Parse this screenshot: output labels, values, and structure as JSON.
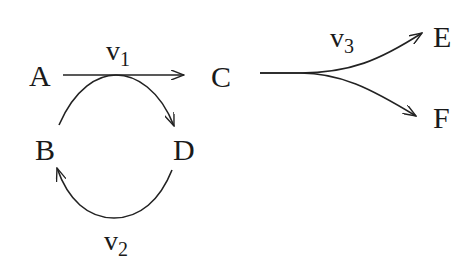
{
  "diagram": {
    "type": "directed-graph",
    "nodes": [
      {
        "id": "A",
        "label": "A"
      },
      {
        "id": "B",
        "label": "B"
      },
      {
        "id": "C",
        "label": "C"
      },
      {
        "id": "D",
        "label": "D"
      },
      {
        "id": "E",
        "label": "E"
      },
      {
        "id": "F",
        "label": "F"
      }
    ],
    "edges": [
      {
        "from": "A",
        "to": "C",
        "label_base": "v",
        "label_sub": "1"
      },
      {
        "from": "B",
        "to": "D",
        "label_base": "v",
        "label_sub": "1",
        "note": "curved arc tangent to v1 line"
      },
      {
        "from": "D",
        "to": "B",
        "label_base": "v",
        "label_sub": "2"
      },
      {
        "from": "C",
        "to": "E",
        "label_base": "v",
        "label_sub": "3"
      },
      {
        "from": "C",
        "to": "F",
        "label_base": "v",
        "label_sub": "3"
      }
    ],
    "edge_labels": {
      "v1": {
        "base": "v",
        "sub": "1"
      },
      "v2": {
        "base": "v",
        "sub": "2"
      },
      "v3": {
        "base": "v",
        "sub": "3"
      }
    },
    "colors": {
      "stroke": "#222222",
      "text": "#1a1a1a",
      "background": "#ffffff"
    }
  }
}
